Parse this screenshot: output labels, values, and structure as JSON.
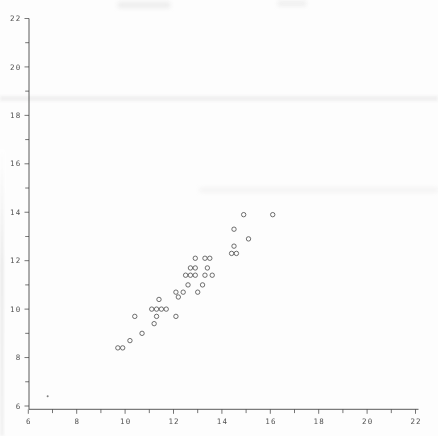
{
  "figure": {
    "background": "#fdfdfd",
    "axis_color": "#3f3f3f",
    "tick_label_color": "#454545",
    "marker_color": "#4a4a4a"
  },
  "chart_data": {
    "type": "scatter",
    "title": "",
    "xlabel": "",
    "ylabel": "",
    "xlim": [
      6,
      22
    ],
    "ylim": [
      6,
      22
    ],
    "x_major_ticks": [
      6,
      8,
      10,
      12,
      14,
      16,
      18,
      20,
      22
    ],
    "y_major_ticks": [
      6,
      8,
      10,
      12,
      14,
      16,
      18,
      20,
      22
    ],
    "minor_tick_step": 1,
    "grid": false,
    "legend_position": "none",
    "marker": "open-circle",
    "points": [
      {
        "x": 14.9,
        "y": 13.9
      },
      {
        "x": 16.1,
        "y": 13.9
      },
      {
        "x": 14.5,
        "y": 13.3
      },
      {
        "x": 15.1,
        "y": 12.9
      },
      {
        "x": 14.5,
        "y": 12.6
      },
      {
        "x": 14.4,
        "y": 12.3
      },
      {
        "x": 14.6,
        "y": 12.3
      },
      {
        "x": 12.9,
        "y": 12.1
      },
      {
        "x": 13.3,
        "y": 12.1
      },
      {
        "x": 13.5,
        "y": 12.1
      },
      {
        "x": 12.7,
        "y": 11.7
      },
      {
        "x": 12.9,
        "y": 11.7
      },
      {
        "x": 13.4,
        "y": 11.7
      },
      {
        "x": 12.5,
        "y": 11.4
      },
      {
        "x": 12.7,
        "y": 11.4
      },
      {
        "x": 12.9,
        "y": 11.4
      },
      {
        "x": 13.3,
        "y": 11.4
      },
      {
        "x": 13.6,
        "y": 11.4
      },
      {
        "x": 12.6,
        "y": 11.0
      },
      {
        "x": 13.2,
        "y": 11.0
      },
      {
        "x": 12.1,
        "y": 10.7
      },
      {
        "x": 12.4,
        "y": 10.7
      },
      {
        "x": 13.0,
        "y": 10.7
      },
      {
        "x": 12.2,
        "y": 10.5
      },
      {
        "x": 11.4,
        "y": 10.4
      },
      {
        "x": 11.1,
        "y": 10.0
      },
      {
        "x": 11.3,
        "y": 10.0
      },
      {
        "x": 11.5,
        "y": 10.0
      },
      {
        "x": 11.7,
        "y": 10.0
      },
      {
        "x": 10.4,
        "y": 9.7
      },
      {
        "x": 11.3,
        "y": 9.7
      },
      {
        "x": 12.1,
        "y": 9.7
      },
      {
        "x": 11.2,
        "y": 9.4
      },
      {
        "x": 10.7,
        "y": 9.0
      },
      {
        "x": 10.2,
        "y": 8.7
      },
      {
        "x": 9.7,
        "y": 8.4
      },
      {
        "x": 9.9,
        "y": 8.4
      }
    ],
    "stray_mark": {
      "x": 6.8,
      "y": 6.4,
      "marker": "dot"
    }
  }
}
